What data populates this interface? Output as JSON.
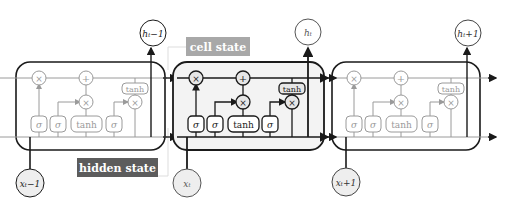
{
  "colors": {
    "active_stroke": "#1a1a1a",
    "inactive_stroke": "#9a9a9a",
    "cell_fill_active": "#f3f3f3",
    "node_fill": "#eeeeee",
    "cell_state_label_bg": "#a8a8a8",
    "hidden_state_label_bg": "#5c5c5c",
    "label_text": "#ffffff"
  },
  "labels": {
    "cell_state": "cell state",
    "hidden_state": "hidden state"
  },
  "cells": [
    {
      "id": "prev",
      "active": false,
      "output_label": "h_t-1",
      "output_text": "hₜ−1",
      "input_label": "x_t-1",
      "input_text": "xₜ−1",
      "gates": {
        "forget": "σ",
        "input": "σ",
        "candidate": "tanh",
        "output": "σ",
        "cell_tanh": "tanh"
      },
      "ops": {
        "forget_mult": "×",
        "add": "+",
        "input_mult": "×",
        "output_mult": "×"
      }
    },
    {
      "id": "curr",
      "active": true,
      "output_label": "h_t",
      "output_text": "hₜ",
      "input_label": "x_t",
      "input_text": "xₜ",
      "gates": {
        "forget": "σ",
        "input": "σ",
        "candidate": "tanh",
        "output": "σ",
        "cell_tanh": "tanh"
      },
      "ops": {
        "forget_mult": "×",
        "add": "+",
        "input_mult": "×",
        "output_mult": "×"
      }
    },
    {
      "id": "next",
      "active": false,
      "output_label": "h_t+1",
      "output_text": "hₜ+1",
      "input_label": "x_t+1",
      "input_text": "xₜ+1",
      "gates": {
        "forget": "σ",
        "input": "σ",
        "candidate": "tanh",
        "output": "σ",
        "cell_tanh": "tanh"
      },
      "ops": {
        "forget_mult": "×",
        "add": "+",
        "input_mult": "×",
        "output_mult": "×"
      }
    }
  ]
}
